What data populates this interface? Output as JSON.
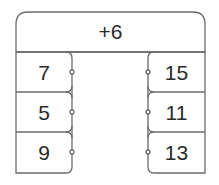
{
  "machine": {
    "rule": "+6",
    "inputs": [
      "7",
      "5",
      "9"
    ],
    "outputs": [
      "15",
      "11",
      "13"
    ]
  },
  "colors": {
    "stroke": "#6b6b6b",
    "text": "#2a2a2a",
    "background": "#ffffff"
  }
}
